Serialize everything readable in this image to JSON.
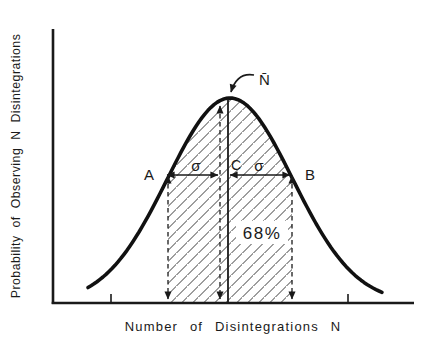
{
  "figure": {
    "background": "#ffffff",
    "ink_color": "#1a1a1a",
    "hatch_color": "#3c3c3c",
    "y_axis_label": "Probability of Observing N Disintegrations",
    "x_axis_label": "Number of Disintegrations N",
    "annotations": {
      "mean_label": "N̄",
      "point_a": "A",
      "point_b": "B",
      "point_c": "C",
      "sigma_left": "σ",
      "sigma_right": "σ",
      "area_percent": "68%"
    }
  },
  "chart_data": {
    "type": "line",
    "curve_shape": "gaussian",
    "xlabel": "Number of Disintegrations N",
    "ylabel": "Probability of Observing N Disintegrations",
    "axis_numeric_tick_labels": "none",
    "x_in_sigma_units": [
      -2.3,
      -2,
      -1.5,
      -1,
      -0.5,
      0,
      0.5,
      1,
      1.5,
      2,
      2.3
    ],
    "y_relative_probability": [
      0.071,
      0.135,
      0.325,
      0.607,
      0.882,
      1.0,
      0.882,
      0.607,
      0.325,
      0.135,
      0.071
    ],
    "mean_label": "N̄",
    "sigma_label": "σ",
    "point_labels": [
      "A",
      "C",
      "B"
    ],
    "shaded_region": {
      "from_sigma": -1,
      "to_sigma": 1,
      "label": "68%",
      "style": "diagonal-hatch"
    },
    "grid": false,
    "legend": "none"
  }
}
